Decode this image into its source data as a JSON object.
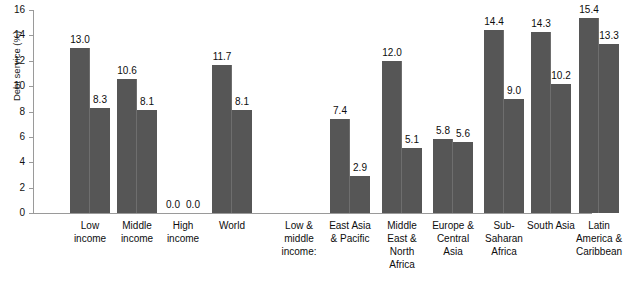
{
  "chart_data": {
    "type": "bar",
    "title": "",
    "xlabel": "",
    "ylabel": "Debt service (%)",
    "ylim": [
      0,
      16
    ],
    "yticks": [
      "0",
      "2",
      "4",
      "6",
      "8",
      "10",
      "12",
      "14",
      "16"
    ],
    "grid": false,
    "legend": "none",
    "bar_color": "#565656",
    "axis_color": "#9a9a9a",
    "categories": [
      "Low income",
      "Middle income",
      "High income",
      "World",
      "Low & middle income:",
      "East Asia & Pacific",
      "Middle East & North Africa",
      "Europe & Central Asia",
      "Sub-Saharan Africa",
      "South Asia",
      "Latin America & Caribbean"
    ],
    "series": [
      {
        "name": "series-1",
        "values": [
          13.0,
          10.6,
          0.0,
          11.7,
          null,
          7.4,
          12.0,
          5.8,
          14.4,
          14.3,
          15.4
        ]
      },
      {
        "name": "series-2",
        "values": [
          8.3,
          8.1,
          0.0,
          8.1,
          null,
          2.9,
          5.1,
          5.6,
          9.0,
          10.2,
          13.3
        ]
      }
    ],
    "groups": [
      {
        "key": "low-income",
        "label": "Low\nincome",
        "values": [
          "13.0",
          "8.3"
        ],
        "numeric": [
          13.0,
          8.3
        ]
      },
      {
        "key": "middle-income",
        "label": "Middle\nincome",
        "values": [
          "10.6",
          "8.1"
        ],
        "numeric": [
          10.6,
          8.1
        ]
      },
      {
        "key": "high-income",
        "label": "High\nincome",
        "values": [
          "0.0",
          "0.0"
        ],
        "numeric": [
          0.0,
          0.0
        ]
      },
      {
        "key": "world",
        "label": "World",
        "values": [
          "11.7",
          "8.1"
        ],
        "numeric": [
          11.7,
          8.1
        ]
      },
      {
        "key": "low-middle-income-header",
        "label": "Low &\nmiddle\nincome:",
        "values": [],
        "numeric": []
      },
      {
        "key": "east-asia-pacific",
        "label": "East Asia\n& Pacific",
        "values": [
          "7.4",
          "2.9"
        ],
        "numeric": [
          7.4,
          2.9
        ]
      },
      {
        "key": "middle-east-north-africa",
        "label": "Middle\nEast &\nNorth\nAfrica",
        "values": [
          "12.0",
          "5.1"
        ],
        "numeric": [
          12.0,
          5.1
        ]
      },
      {
        "key": "europe-central-asia",
        "label": "Europe &\nCentral\nAsia",
        "values": [
          "5.8",
          "5.6"
        ],
        "numeric": [
          5.8,
          5.6
        ]
      },
      {
        "key": "sub-saharan-africa",
        "label": "Sub-\nSaharan\nAfrica",
        "values": [
          "14.4",
          "9.0"
        ],
        "numeric": [
          14.4,
          9.0
        ]
      },
      {
        "key": "south-asia",
        "label": "South Asia",
        "values": [
          "14.3",
          "10.2"
        ],
        "numeric": [
          14.3,
          10.2
        ]
      },
      {
        "key": "latin-america-caribbean",
        "label": "Latin\nAmerica &\nCaribbean",
        "values": [
          "15.4",
          "13.3"
        ],
        "numeric": [
          15.4,
          13.3
        ]
      }
    ]
  }
}
